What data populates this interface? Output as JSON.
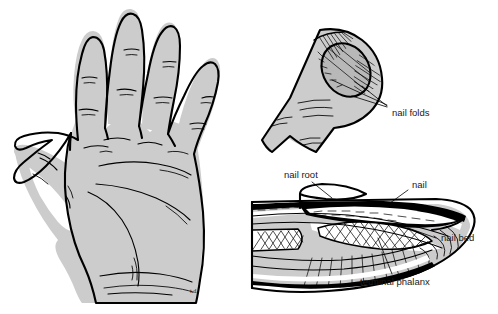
{
  "figure": {
    "background_color": "#ffffff",
    "skin_fill_color": "#cccccc",
    "ink_color": "#000000",
    "width": 498,
    "height": 314
  },
  "panels": [
    {
      "id": "palm",
      "name": "palmar-view-of-hand",
      "caption": "",
      "signature": "t.d."
    },
    {
      "id": "fingertip",
      "name": "fingertip-dorsal-view",
      "caption": ""
    },
    {
      "id": "section",
      "name": "sagittal-section-of-finger-tip",
      "caption": ""
    }
  ],
  "labels": {
    "nail_folds": "nail folds",
    "nail_root": "nail root",
    "nail": "nail",
    "nail_bed": "nail bed",
    "terminal_phalanx": "terminal phalanx"
  },
  "signature": {
    "mark": "t.d."
  }
}
